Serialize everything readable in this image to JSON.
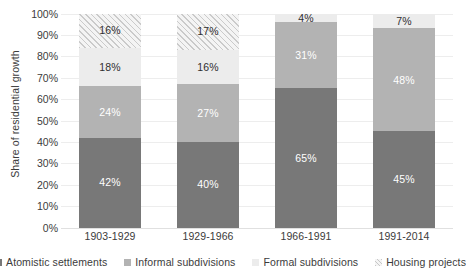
{
  "chart_data": {
    "type": "bar",
    "subtype": "stacked-100-percent",
    "title": "",
    "xlabel": "",
    "ylabel": "Share of residential growth",
    "ylim": [
      0,
      100
    ],
    "y_tick_labels": [
      "100%",
      "90%",
      "80%",
      "70%",
      "60%",
      "50%",
      "40%",
      "30%",
      "20%",
      "10%",
      "0%"
    ],
    "y_tick_values": [
      100,
      90,
      80,
      70,
      60,
      50,
      40,
      30,
      20,
      10,
      0
    ],
    "grid": true,
    "grid_axis": "y",
    "legend_position": "bottom",
    "categories": [
      "1903-1929",
      "1929-1966",
      "1966-1991",
      "1991-2014"
    ],
    "series": [
      {
        "name": "Atomistic settlements",
        "color": "#787878",
        "values": [
          42,
          40,
          65,
          45
        ],
        "labels": [
          "42%",
          "40%",
          "65%",
          "45%"
        ]
      },
      {
        "name": "Informal subdivisions",
        "color": "#b3b3b3",
        "values": [
          24,
          27,
          31,
          48
        ],
        "labels": [
          "24%",
          "27%",
          "31%",
          "48%"
        ]
      },
      {
        "name": "Formal subdivisions",
        "color": "#ececec",
        "values": [
          18,
          16,
          4,
          7
        ],
        "labels": [
          "18%",
          "16%",
          "4%",
          "7%"
        ]
      },
      {
        "name": "Housing projects",
        "color": "#f4f4f4",
        "pattern": "diagonal-hatch",
        "values": [
          16,
          17,
          0,
          0
        ],
        "labels": [
          "16%",
          "17%",
          "",
          ""
        ]
      }
    ]
  },
  "y_axis": {
    "title": "Share of residential growth",
    "ticks": [
      "100%",
      "90%",
      "80%",
      "70%",
      "60%",
      "50%",
      "40%",
      "30%",
      "20%",
      "10%",
      "0%"
    ]
  },
  "x_axis": {
    "ticks": [
      "1903-1929",
      "1929-1966",
      "1966-1991",
      "1991-2014"
    ]
  },
  "legend": {
    "items": [
      {
        "label": "Atomistic settlements",
        "swatch": "swatch-atomistic-settlements"
      },
      {
        "label": "Informal subdivisions",
        "swatch": "swatch-informal-subdivisions"
      },
      {
        "label": "Formal subdivisions",
        "swatch": "swatch-formal-subdivisions"
      },
      {
        "label": "Housing projects",
        "swatch": "swatch-housing-projects"
      }
    ]
  },
  "bars": [
    {
      "category": "1903-1929",
      "segments": [
        {
          "series": "Housing projects",
          "value": 16,
          "label": "16%",
          "style": "seg-housing",
          "text": "label-dark"
        },
        {
          "series": "Formal subdivisions",
          "value": 18,
          "label": "18%",
          "style": "seg-formal",
          "text": "label-dark"
        },
        {
          "series": "Informal subdivisions",
          "value": 24,
          "label": "24%",
          "style": "seg-informal",
          "text": "label-light"
        },
        {
          "series": "Atomistic settlements",
          "value": 42,
          "label": "42%",
          "style": "seg-atomistic",
          "text": "label-light"
        }
      ]
    },
    {
      "category": "1929-1966",
      "segments": [
        {
          "series": "Housing projects",
          "value": 17,
          "label": "17%",
          "style": "seg-housing",
          "text": "label-dark"
        },
        {
          "series": "Formal subdivisions",
          "value": 16,
          "label": "16%",
          "style": "seg-formal",
          "text": "label-dark"
        },
        {
          "series": "Informal subdivisions",
          "value": 27,
          "label": "27%",
          "style": "seg-informal",
          "text": "label-light"
        },
        {
          "series": "Atomistic settlements",
          "value": 40,
          "label": "40%",
          "style": "seg-atomistic",
          "text": "label-light"
        }
      ]
    },
    {
      "category": "1966-1991",
      "segments": [
        {
          "series": "Formal subdivisions",
          "value": 4,
          "label": "4%",
          "style": "seg-formal",
          "text": "label-dark"
        },
        {
          "series": "Informal subdivisions",
          "value": 31,
          "label": "31%",
          "style": "seg-informal",
          "text": "label-light"
        },
        {
          "series": "Atomistic settlements",
          "value": 65,
          "label": "65%",
          "style": "seg-atomistic",
          "text": "label-light"
        }
      ]
    },
    {
      "category": "1991-2014",
      "segments": [
        {
          "series": "Formal subdivisions",
          "value": 7,
          "label": "7%",
          "style": "seg-formal",
          "text": "label-dark"
        },
        {
          "series": "Informal subdivisions",
          "value": 48,
          "label": "48%",
          "style": "seg-informal",
          "text": "label-light"
        },
        {
          "series": "Atomistic settlements",
          "value": 45,
          "label": "45%",
          "style": "seg-atomistic",
          "text": "label-light"
        }
      ]
    }
  ]
}
